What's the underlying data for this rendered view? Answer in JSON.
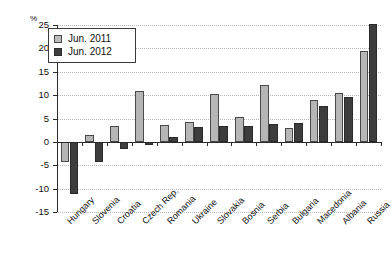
{
  "chart_data": {
    "type": "bar",
    "title": "",
    "xlabel": "",
    "ylabel": "%",
    "ylim": [
      -15,
      25
    ],
    "ytick_values": [
      25,
      20,
      15,
      10,
      5,
      0,
      -5,
      -10,
      -15
    ],
    "ytick_labels": [
      "25",
      "20",
      "15",
      "10",
      "5",
      "0",
      "-5",
      "-10",
      "-15"
    ],
    "grid": true,
    "legend_position": "top-left",
    "categories": [
      "Hungary",
      "Slovenia",
      "Croatia",
      "Czech Rep.",
      "Romania",
      "Ukraine",
      "Slovakia",
      "Bosnia",
      "Serbia",
      "Bulgaria",
      "Macedonia",
      "Albania",
      "Russia"
    ],
    "series": [
      {
        "name": "Jun. 2011",
        "color": "#b6b6b6",
        "values": [
          -4.2,
          1.5,
          3.4,
          10.8,
          3.7,
          4.3,
          10.2,
          5.3,
          12.2,
          3.0,
          8.9,
          10.4,
          19.5
        ]
      },
      {
        "name": "Jun. 2012",
        "color": "#3d3d3d",
        "values": [
          -11.2,
          -4.4,
          -1.5,
          -0.7,
          1.0,
          3.2,
          3.5,
          3.5,
          3.9,
          4.0,
          7.7,
          9.5,
          25.2
        ]
      }
    ]
  }
}
